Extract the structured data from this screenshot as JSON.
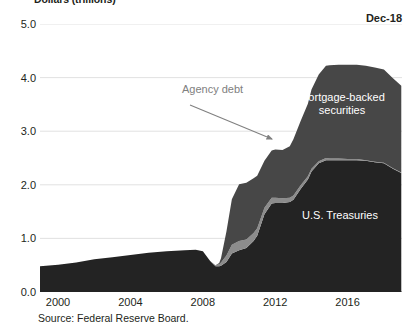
{
  "chart_data": {
    "type": "area",
    "title": "Dollars (trillions)",
    "date_stamp": "Dec-18",
    "source": "Source: Federal Reserve Board.",
    "xlabel": "",
    "ylabel": "Dollars (trillions)",
    "ylim": [
      0,
      5
    ],
    "xlim": [
      1999,
      2019
    ],
    "grid": true,
    "legend_position": "inline-labels",
    "ytick_labels": [
      "0.0",
      "1.0",
      "2.0",
      "3.0",
      "4.0",
      "5.0"
    ],
    "ytick_values": [
      0,
      1,
      2,
      3,
      4,
      5
    ],
    "xtick_labels": [
      "2000",
      "2004",
      "2008",
      "2012",
      "2016"
    ],
    "xtick_values": [
      2000,
      2004,
      2008,
      2012,
      2016
    ],
    "x": [
      1999.0,
      2000.0,
      2001.0,
      2002.0,
      2003.0,
      2004.0,
      2005.0,
      2006.0,
      2007.0,
      2007.6,
      2008.0,
      2008.4,
      2008.7,
      2008.9,
      2009.0,
      2009.3,
      2009.6,
      2010.0,
      2010.4,
      2010.8,
      2011.0,
      2011.4,
      2011.8,
      2012.0,
      2012.4,
      2012.8,
      2013.0,
      2013.4,
      2013.8,
      2014.0,
      2014.4,
      2014.8,
      2015.0,
      2015.5,
      2016.0,
      2016.5,
      2017.0,
      2017.5,
      2018.0,
      2018.5,
      2018.96
    ],
    "series": [
      {
        "name": "U.S. Treasuries",
        "color": "#232323",
        "values": [
          0.48,
          0.51,
          0.55,
          0.61,
          0.65,
          0.69,
          0.73,
          0.76,
          0.78,
          0.79,
          0.76,
          0.58,
          0.48,
          0.48,
          0.49,
          0.56,
          0.72,
          0.78,
          0.82,
          0.95,
          1.05,
          1.45,
          1.65,
          1.66,
          1.66,
          1.68,
          1.72,
          1.92,
          2.1,
          2.25,
          2.4,
          2.46,
          2.46,
          2.46,
          2.46,
          2.46,
          2.45,
          2.42,
          2.4,
          2.3,
          2.22
        ]
      },
      {
        "name": "Agency debt",
        "color": "#8c8c8c",
        "values": [
          0.0,
          0.0,
          0.0,
          0.0,
          0.0,
          0.0,
          0.0,
          0.0,
          0.0,
          0.0,
          0.0,
          0.0,
          0.02,
          0.04,
          0.06,
          0.12,
          0.16,
          0.17,
          0.16,
          0.15,
          0.14,
          0.12,
          0.11,
          0.1,
          0.09,
          0.08,
          0.08,
          0.07,
          0.06,
          0.05,
          0.04,
          0.04,
          0.03,
          0.03,
          0.02,
          0.02,
          0.01,
          0.01,
          0.01,
          0.01,
          0.01
        ]
      },
      {
        "name": "Mortgage-backed securities",
        "color": "#474747",
        "values": [
          0.0,
          0.0,
          0.0,
          0.0,
          0.0,
          0.0,
          0.0,
          0.0,
          0.0,
          0.0,
          0.0,
          0.0,
          0.0,
          0.02,
          0.08,
          0.45,
          0.85,
          1.06,
          1.06,
          1.02,
          0.98,
          0.88,
          0.88,
          0.9,
          0.9,
          0.96,
          1.05,
          1.2,
          1.35,
          1.48,
          1.62,
          1.72,
          1.74,
          1.75,
          1.76,
          1.76,
          1.76,
          1.76,
          1.74,
          1.68,
          1.62
        ]
      }
    ],
    "annotations": [
      {
        "text": "Agency debt",
        "kind": "arrow-label",
        "color": "#808080",
        "label_x": 182,
        "label_y": 90,
        "arrow_from_x": 190,
        "arrow_from_y": 105,
        "arrow_to_x": 272,
        "arrow_to_y": 139
      },
      {
        "text": "Mortgage-backed\nsecurities",
        "kind": "series-label",
        "color": "#ffffff",
        "label_x": 342,
        "label_y": 104
      },
      {
        "text": "U.S. Treasuries",
        "kind": "series-label",
        "color": "#ffffff",
        "label_x": 340,
        "label_y": 216
      }
    ],
    "colors": {
      "treasuries": "#232323",
      "agency_debt": "#8c8c8c",
      "mbs": "#474747",
      "grid": "#d9d9d9",
      "axis": "#595959",
      "annotation": "#808080",
      "text": "#231f20"
    }
  }
}
